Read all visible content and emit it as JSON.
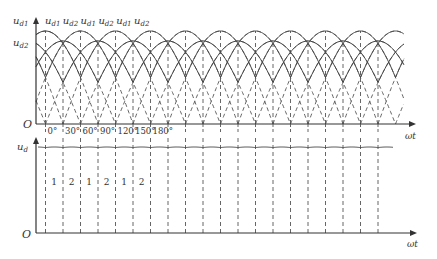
{
  "top_plot": {
    "y_labels": [
      "u_d1",
      "u_d2"
    ],
    "origin_label": "O",
    "x_axis_label": "ωt",
    "curve_labels": [
      "u_d1",
      "u_d2",
      "u_d1",
      "u_d2",
      "u_d1",
      "u_d2"
    ],
    "angle_ticks": [
      "0°",
      "30°",
      "60°",
      "90°",
      "120°",
      "150°",
      "180°"
    ]
  },
  "bottom_plot": {
    "y_label": "u_d",
    "origin_label": "O",
    "x_axis_label": "ωt",
    "interval_labels": [
      "1",
      "2",
      "1",
      "2",
      "1",
      "2"
    ]
  },
  "geometry": {
    "x0": 36,
    "first_line_x": 45.5,
    "step_30deg_px": 17.5,
    "num_lines": 21,
    "top_axis_y": 124,
    "top_axis_end": 416,
    "top_axis_top": 17,
    "ud1_peak_y": 31,
    "ud2_peak_y": 41,
    "curves_end_x": 404,
    "bottom_axis_y": 233,
    "bottom_axis_top": 137,
    "bottom_axis_end": 417,
    "ripple_y": 147,
    "ripple_end_x": 393
  },
  "colors": {
    "line": "#444444",
    "dash": "#555555"
  }
}
